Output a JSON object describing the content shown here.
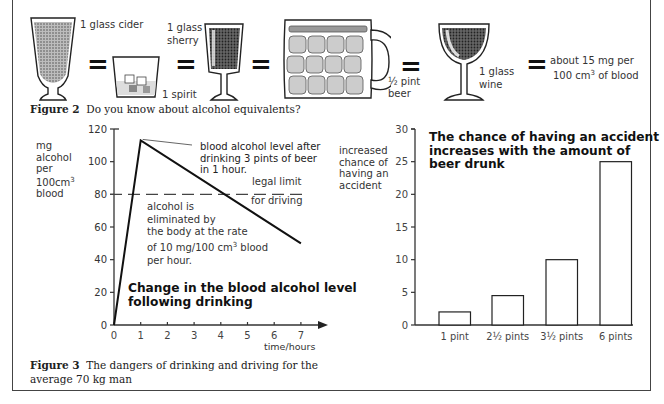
{
  "figure2": {
    "caption_label": "Figure 2",
    "caption_text": "Do you know about alcohol equivalents?",
    "equals_sign": "=",
    "items": [
      {
        "name": "cider-glass",
        "label": "1 glass cider"
      },
      {
        "name": "spirit-glass",
        "label": "1 spirit"
      },
      {
        "name": "sherry-glass",
        "label_line1": "1 glass",
        "label_line2": "sherry"
      },
      {
        "name": "beer-mug",
        "label_line1": "½ pint",
        "label_line2": "beer"
      },
      {
        "name": "wine-glass",
        "label_line1": "1 glass",
        "label_line2": "wine"
      }
    ],
    "equivalent_line1": "about 15 mg per",
    "equivalent_line2_pre": "100 cm",
    "equivalent_line2_sup": "3",
    "equivalent_line2_post": " of blood"
  },
  "figure3": {
    "caption_label": "Figure 3",
    "caption_text": "The dangers of drinking and driving for the",
    "caption_text_line2": "average 70 kg man"
  },
  "chart_data": [
    {
      "type": "line",
      "title": "Change in the blood alcohol level following drinking",
      "title_line1": "Change in the blood alcohol level",
      "title_line2": "following drinking",
      "ylabel_lines": [
        "mg",
        "alcohol",
        "per",
        "100cm",
        "blood"
      ],
      "ylabel_sup": "3",
      "xlabel": "time/hours",
      "x": [
        0,
        1,
        7
      ],
      "y": [
        0,
        113,
        50
      ],
      "xlim": [
        0,
        7
      ],
      "ylim": [
        0,
        120
      ],
      "xticks": [
        0,
        1,
        2,
        3,
        4,
        5,
        6,
        7
      ],
      "yticks": [
        0,
        20,
        40,
        60,
        80,
        100,
        120
      ],
      "reference_line": {
        "y": 80,
        "style": "dashed",
        "label_line1": "legal limit",
        "label_line2": "for driving"
      },
      "annotations": {
        "peak": [
          "blood alcohol level after",
          "drinking 3 pints of beer",
          "in 1 hour."
        ],
        "elimination": [
          "alcohol is",
          "eliminated by",
          "the body at the rate",
          "of 10 mg/100 cm",
          "per hour."
        ],
        "elimination_sup": "3",
        "elimination_post": " blood"
      },
      "grid": false
    },
    {
      "type": "bar",
      "title": "The chance of having an accident increases with the amount of beer drunk",
      "title_lines": [
        "The chance of having an accident",
        "increases with the amount of",
        "beer drunk"
      ],
      "ylabel_lines": [
        "increased",
        "chance of",
        "having an",
        "accident"
      ],
      "categories": [
        "1 pint",
        "2½ pints",
        "3½ pints",
        "6 pints"
      ],
      "values": [
        2,
        4.5,
        10,
        25
      ],
      "ylim": [
        0,
        30
      ],
      "yticks": [
        0,
        5,
        10,
        15,
        20,
        25,
        30
      ],
      "grid": false
    }
  ]
}
